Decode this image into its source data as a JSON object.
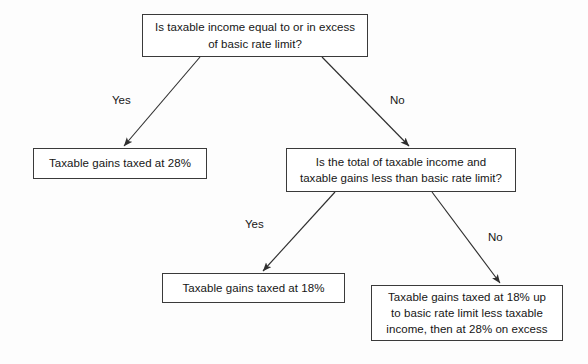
{
  "diagram": {
    "nodes": {
      "q1": {
        "text": "Is taxable income equal to or in excess\nof basic rate limit?",
        "type": "decision"
      },
      "out_28": {
        "text": "Taxable gains taxed at 28%",
        "type": "outcome"
      },
      "q2": {
        "text": "Is the total of taxable income and\ntaxable gains less than basic rate limit?",
        "type": "decision"
      },
      "out_18": {
        "text": "Taxable gains taxed at 18%",
        "type": "outcome"
      },
      "out_mixed": {
        "text": "Taxable gains taxed at 18% up\nto basic rate limit less taxable\nincome, then at 28% on excess",
        "type": "outcome"
      }
    },
    "edges": {
      "q1_yes": "Yes",
      "q1_no": "No",
      "q2_yes": "Yes",
      "q2_no": "No"
    },
    "colors": {
      "border": "#3a3a3a",
      "text": "#161616",
      "arrow": "#2f2f2f",
      "background": "#fdfdfd"
    }
  }
}
